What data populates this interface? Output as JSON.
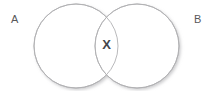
{
  "diagram": {
    "type": "venn-two-set",
    "background_color": "#ffffff",
    "stroke_color": "#b1b1b3",
    "shadow_color": "#d9d9db",
    "sets": [
      {
        "id": "set-a",
        "label": "A",
        "label_color": "#58585a",
        "cx": 76,
        "cy": 46,
        "r": 42
      },
      {
        "id": "set-b",
        "label": "B",
        "label_color": "#58585a",
        "cx": 137,
        "cy": 46,
        "r": 42
      }
    ],
    "intersection": {
      "marker": "X",
      "marker_color": "#44454a",
      "cx": 106,
      "cy": 45
    }
  }
}
